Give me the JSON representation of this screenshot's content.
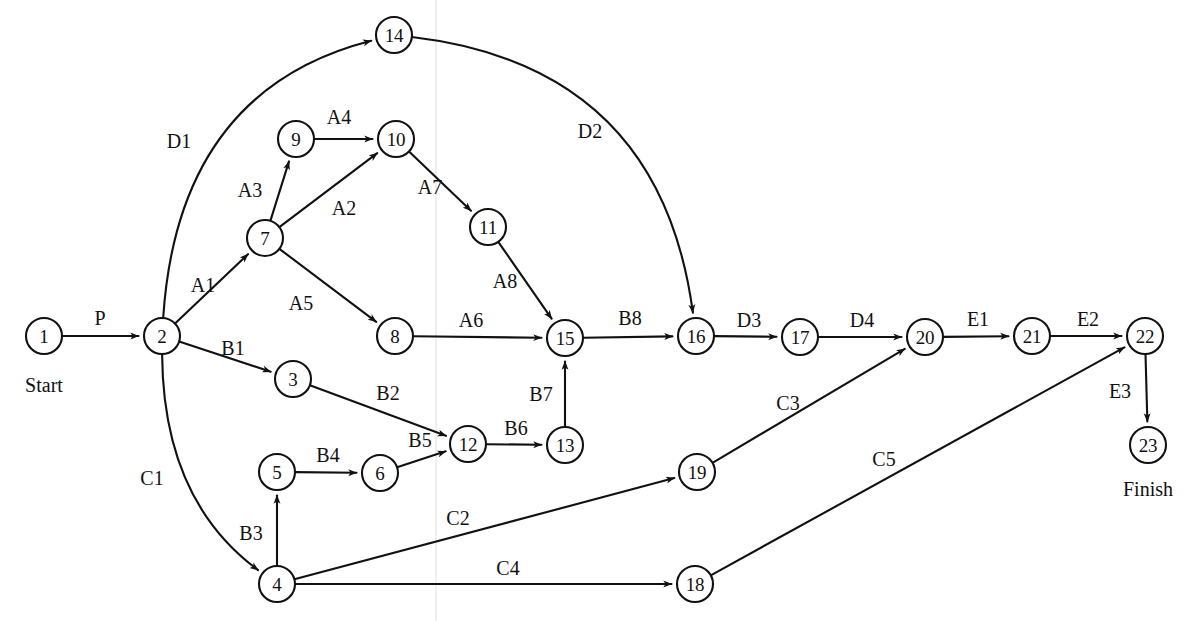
{
  "diagram": {
    "type": "activity-on-node-project-network",
    "canvas": {
      "width": 1194,
      "height": 621
    },
    "node_radius": 18,
    "colors": {
      "background": "#ffffff",
      "stroke": "#111111",
      "node_fill": "#ffffff",
      "fold_crease": "#e9e9ea"
    },
    "terminals": [
      {
        "name": "start-terminal",
        "text": "Start",
        "x": 44,
        "y": 385
      },
      {
        "name": "finish-terminal",
        "text": "Finish",
        "x": 1148,
        "y": 489
      }
    ],
    "nodes": [
      {
        "id": "1",
        "label": "1",
        "x": 44,
        "y": 336
      },
      {
        "id": "2",
        "label": "2",
        "x": 162,
        "y": 336
      },
      {
        "id": "3",
        "label": "3",
        "x": 293,
        "y": 379
      },
      {
        "id": "4",
        "label": "4",
        "x": 277,
        "y": 584
      },
      {
        "id": "5",
        "label": "5",
        "x": 277,
        "y": 472
      },
      {
        "id": "6",
        "label": "6",
        "x": 380,
        "y": 473
      },
      {
        "id": "7",
        "label": "7",
        "x": 265,
        "y": 238
      },
      {
        "id": "8",
        "label": "8",
        "x": 395,
        "y": 336
      },
      {
        "id": "9",
        "label": "9",
        "x": 296,
        "y": 139
      },
      {
        "id": "10",
        "label": "10",
        "x": 396,
        "y": 139
      },
      {
        "id": "11",
        "label": "11",
        "x": 488,
        "y": 227
      },
      {
        "id": "12",
        "label": "12",
        "x": 468,
        "y": 444
      },
      {
        "id": "13",
        "label": "13",
        "x": 565,
        "y": 445
      },
      {
        "id": "14",
        "label": "14",
        "x": 394,
        "y": 35
      },
      {
        "id": "15",
        "label": "15",
        "x": 565,
        "y": 338
      },
      {
        "id": "16",
        "label": "16",
        "x": 696,
        "y": 336
      },
      {
        "id": "17",
        "label": "17",
        "x": 800,
        "y": 337
      },
      {
        "id": "18",
        "label": "18",
        "x": 695,
        "y": 584
      },
      {
        "id": "19",
        "label": "19",
        "x": 697,
        "y": 472
      },
      {
        "id": "20",
        "label": "20",
        "x": 925,
        "y": 337
      },
      {
        "id": "21",
        "label": "21",
        "x": 1032,
        "y": 336
      },
      {
        "id": "22",
        "label": "22",
        "x": 1145,
        "y": 336
      },
      {
        "id": "23",
        "label": "23",
        "x": 1148,
        "y": 445
      }
    ],
    "edges": [
      {
        "id": "P",
        "label": "P",
        "from": "1",
        "to": "2",
        "shape": "straight",
        "label_x": 100,
        "label_y": 318
      },
      {
        "id": "D1",
        "label": "D1",
        "from": "2",
        "to": "14",
        "shape": "curve",
        "curve_x": 178,
        "curve_y": 90,
        "label_x": 179,
        "label_y": 141
      },
      {
        "id": "A1",
        "label": "A1",
        "from": "2",
        "to": "7",
        "shape": "straight",
        "label_x": 203,
        "label_y": 285
      },
      {
        "id": "B1",
        "label": "B1",
        "from": "2",
        "to": "3",
        "shape": "straight",
        "label_x": 233,
        "label_y": 348
      },
      {
        "id": "C1",
        "label": "C1",
        "from": "2",
        "to": "4",
        "shape": "curve",
        "curve_x": 163,
        "curve_y": 500,
        "label_x": 152,
        "label_y": 478
      },
      {
        "id": "A3",
        "label": "A3",
        "from": "7",
        "to": "9",
        "shape": "straight",
        "label_x": 250,
        "label_y": 190
      },
      {
        "id": "A2",
        "label": "A2",
        "from": "7",
        "to": "10",
        "shape": "straight",
        "label_x": 344,
        "label_y": 208
      },
      {
        "id": "A5",
        "label": "A5",
        "from": "7",
        "to": "8",
        "shape": "straight",
        "label_x": 301,
        "label_y": 303
      },
      {
        "id": "A4",
        "label": "A4",
        "from": "9",
        "to": "10",
        "shape": "straight",
        "label_x": 339,
        "label_y": 117
      },
      {
        "id": "A7",
        "label": "A7",
        "from": "10",
        "to": "11",
        "shape": "straight",
        "label_x": 430,
        "label_y": 187
      },
      {
        "id": "A8",
        "label": "A8",
        "from": "11",
        "to": "15",
        "shape": "straight",
        "label_x": 505,
        "label_y": 281
      },
      {
        "id": "A6",
        "label": "A6",
        "from": "8",
        "to": "15",
        "shape": "straight",
        "label_x": 471,
        "label_y": 320
      },
      {
        "id": "D2",
        "label": "D2",
        "from": "14",
        "to": "16",
        "shape": "curve",
        "curve_x": 660,
        "curve_y": 66,
        "label_x": 590,
        "label_y": 131
      },
      {
        "id": "B2",
        "label": "B2",
        "from": "3",
        "to": "12",
        "shape": "straight",
        "label_x": 388,
        "label_y": 393
      },
      {
        "id": "B3",
        "label": "B3",
        "from": "4",
        "to": "5",
        "shape": "straight",
        "label_x": 251,
        "label_y": 533
      },
      {
        "id": "B4",
        "label": "B4",
        "from": "5",
        "to": "6",
        "shape": "straight",
        "label_x": 328,
        "label_y": 455
      },
      {
        "id": "B5",
        "label": "B5",
        "from": "6",
        "to": "12",
        "shape": "straight",
        "label_x": 420,
        "label_y": 440
      },
      {
        "id": "B6",
        "label": "B6",
        "from": "12",
        "to": "13",
        "shape": "straight",
        "label_x": 516,
        "label_y": 428
      },
      {
        "id": "B7",
        "label": "B7",
        "from": "13",
        "to": "15",
        "shape": "straight",
        "label_x": 541,
        "label_y": 394
      },
      {
        "id": "B8",
        "label": "B8",
        "from": "15",
        "to": "16",
        "shape": "straight",
        "label_x": 630,
        "label_y": 318
      },
      {
        "id": "D3",
        "label": "D3",
        "from": "16",
        "to": "17",
        "shape": "straight",
        "label_x": 749,
        "label_y": 320
      },
      {
        "id": "D4",
        "label": "D4",
        "from": "17",
        "to": "20",
        "shape": "straight",
        "label_x": 862,
        "label_y": 320
      },
      {
        "id": "C2",
        "label": "C2",
        "from": "4",
        "to": "19",
        "shape": "straight",
        "label_x": 458,
        "label_y": 518
      },
      {
        "id": "C4",
        "label": "C4",
        "from": "4",
        "to": "18",
        "shape": "straight",
        "label_x": 508,
        "label_y": 568
      },
      {
        "id": "C3",
        "label": "C3",
        "from": "19",
        "to": "20",
        "shape": "straight",
        "label_x": 788,
        "label_y": 403
      },
      {
        "id": "C5",
        "label": "C5",
        "from": "18",
        "to": "22",
        "shape": "straight",
        "label_x": 884,
        "label_y": 459
      },
      {
        "id": "E1",
        "label": "E1",
        "from": "20",
        "to": "21",
        "shape": "straight",
        "label_x": 978,
        "label_y": 319
      },
      {
        "id": "E2",
        "label": "E2",
        "from": "21",
        "to": "22",
        "shape": "straight",
        "label_x": 1088,
        "label_y": 319
      },
      {
        "id": "E3",
        "label": "E3",
        "from": "22",
        "to": "23",
        "shape": "straight",
        "label_x": 1120,
        "label_y": 391
      }
    ]
  }
}
